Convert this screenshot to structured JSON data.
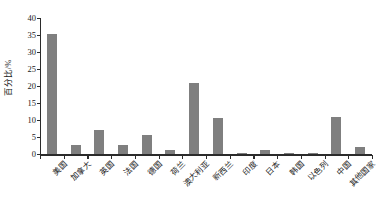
{
  "chart_data": {
    "type": "bar",
    "title": "",
    "subtitle": "",
    "xlabel": "",
    "ylabel": "百分比/%",
    "ylim": [
      0,
      40
    ],
    "yticks": [
      0,
      5,
      10,
      15,
      20,
      25,
      30,
      35,
      40
    ],
    "ytick_labels": [
      "0",
      "5",
      "10",
      "15",
      "20",
      "25",
      "30",
      "35",
      "40"
    ],
    "grid": false,
    "legend": null,
    "bar_color": "#7f7f7f",
    "axis_color": "#2b2b2b",
    "categories": [
      "美国",
      "加拿大",
      "英国",
      "法国",
      "德国",
      "荷兰",
      "澳大利亚",
      "新西兰",
      "印度",
      "日本",
      "韩国",
      "以色列",
      "中国",
      "其他国家"
    ],
    "values": [
      35.2,
      2.7,
      7.2,
      2.7,
      5.6,
      1.2,
      21.0,
      10.5,
      0.2,
      1.3,
      0.2,
      0.2,
      10.8,
      2.0
    ],
    "series": [
      {
        "name": "百分比",
        "values": [
          35.2,
          2.7,
          7.2,
          2.7,
          5.6,
          1.2,
          21.0,
          10.5,
          0.2,
          1.3,
          0.2,
          0.2,
          10.8,
          2.0
        ]
      }
    ]
  }
}
